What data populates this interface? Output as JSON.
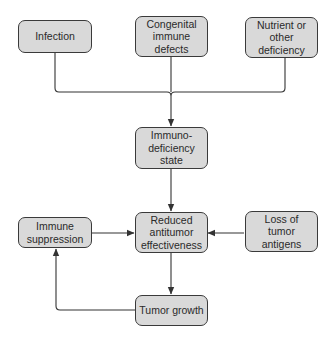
{
  "diagram": {
    "type": "flowchart",
    "colors": {
      "box_fill": "#d9d9d9",
      "box_border": "#3a3a3a",
      "line": "#333333",
      "text": "#2a2a2a"
    },
    "nodes": {
      "infection": {
        "label": "Infection"
      },
      "congenital": {
        "label": "Congenital\nimmune\ndefects"
      },
      "nutrient": {
        "label": "Nutrient or\nother\ndeficiency"
      },
      "immunodeficiency": {
        "label": "Immuno-\ndeficiency\nstate"
      },
      "reduced": {
        "label": "Reduced\nantitumor\neffectiveness"
      },
      "immune_suppression": {
        "label": "Immune\nsuppression"
      },
      "loss_antigens": {
        "label": "Loss of\ntumor\nantigens"
      },
      "tumor_growth": {
        "label": "Tumor growth"
      }
    },
    "edges": [
      {
        "from": "infection",
        "to": "immunodeficiency"
      },
      {
        "from": "congenital",
        "to": "immunodeficiency"
      },
      {
        "from": "nutrient",
        "to": "immunodeficiency"
      },
      {
        "from": "immunodeficiency",
        "to": "reduced"
      },
      {
        "from": "immune_suppression",
        "to": "reduced"
      },
      {
        "from": "loss_antigens",
        "to": "reduced"
      },
      {
        "from": "reduced",
        "to": "tumor_growth"
      },
      {
        "from": "tumor_growth",
        "to": "immune_suppression"
      }
    ]
  }
}
